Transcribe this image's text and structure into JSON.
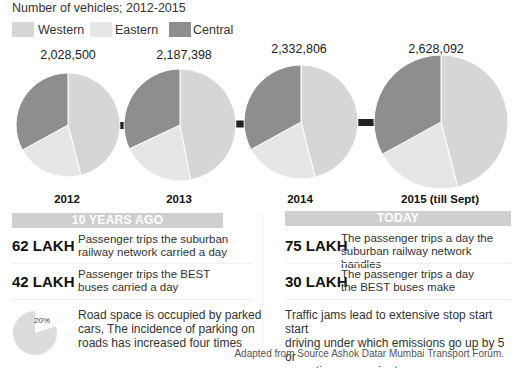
{
  "chart_data": {
    "type": "pie",
    "title": "Number of vehicles; 2012-2015",
    "legend": [
      {
        "name": "Western",
        "color": "#d6d6d6"
      },
      {
        "name": "Eastern",
        "color": "#e6e6e6"
      },
      {
        "name": "Central",
        "color": "#8e8e8e"
      }
    ],
    "legend_position": "top-left",
    "categories": [
      "Western",
      "Eastern",
      "Central"
    ],
    "pies": [
      {
        "year_label": "2012",
        "total": "2,028,500",
        "shares_pct": [
          46,
          21,
          33
        ]
      },
      {
        "year_label": "2013",
        "total": "2,187,398",
        "shares_pct": [
          47,
          21,
          32
        ]
      },
      {
        "year_label": "2014",
        "total": "2,332,806",
        "shares_pct": [
          46,
          21,
          33
        ]
      },
      {
        "year_label": "2015 (till Sept)",
        "total": "2,628,092",
        "shares_pct": [
          46,
          21,
          33
        ]
      }
    ]
  },
  "connector_color": "#222222",
  "ten_years_ago": {
    "header": "10 YEARS AGO",
    "rows": [
      {
        "value": "62 LAKH",
        "line1": "Passenger trips the suburban",
        "line2": "railway network carried a day"
      },
      {
        "value": "42 LAKH",
        "line1": "Passenger trips the BEST",
        "line2": "buses carried a day"
      }
    ],
    "parking": {
      "pct_label": "20%",
      "pct_value": 20,
      "line1": "Road space is occupied by parked",
      "line2": "cars, The incidence of parking on",
      "line3": "roads has increased four times"
    }
  },
  "today": {
    "header": "TODAY",
    "rows": [
      {
        "value": "75 LAKH",
        "line1": "The passenger trips a day the",
        "line2": "suburban railway network handles"
      },
      {
        "value": "30 LAKH",
        "line1": "The passenger trips a day",
        "line2": "the BEST buses make"
      }
    ],
    "traffic": {
      "line1": "Traffic jams lead to extensive stop start start",
      "line2": "driving under which emissions go up by 5 or",
      "line3": "more times per minute"
    }
  },
  "footer": "Adapted from Source Ashok Datar Mumbai Transport Forum."
}
